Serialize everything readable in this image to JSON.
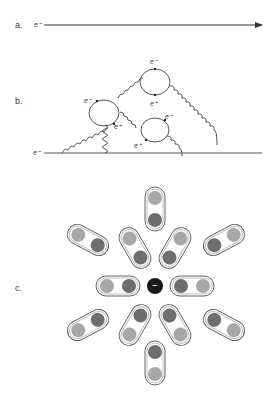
{
  "panels": {
    "a": {
      "label": "a.",
      "particle": "e⁻"
    },
    "b": {
      "label": "b.",
      "incoming_particle": "e⁻",
      "loops": [
        {
          "top": "e⁻",
          "bottom": "e⁺"
        },
        {
          "top": "e⁻",
          "bottom": "e⁺"
        },
        {
          "top": "e⁻",
          "bottom": "e⁺"
        }
      ]
    },
    "c": {
      "label": "c.",
      "central_charge": "−",
      "dipoles": [
        {
          "orientation": "up",
          "inner": "+",
          "outer": "−"
        },
        {
          "orientation": "down",
          "inner": "+",
          "outer": "−"
        },
        {
          "orientation": "left",
          "inner": "+",
          "outer": "−"
        },
        {
          "orientation": "right",
          "inner": "+",
          "outer": "−"
        },
        {
          "orientation": "up-left-inner",
          "inner": "+",
          "outer": "−"
        },
        {
          "orientation": "up-right-inner",
          "inner": "+",
          "outer": "−"
        },
        {
          "orientation": "down-left-inner",
          "inner": "+",
          "outer": "−"
        },
        {
          "orientation": "down-right-inner",
          "inner": "+",
          "outer": "−"
        },
        {
          "orientation": "up-left-outer",
          "inner": "+",
          "outer": "−"
        },
        {
          "orientation": "up-right-outer",
          "inner": "+",
          "outer": "−"
        },
        {
          "orientation": "down-left-outer",
          "inner": "+",
          "outer": "−"
        },
        {
          "orientation": "down-right-outer",
          "inner": "+",
          "outer": "−"
        }
      ]
    }
  },
  "colors": {
    "line": "#444444",
    "plus_fill": "#6e6e6e",
    "minus_fill": "#a8a8a8",
    "center_fill": "#1a1a1a",
    "capsule_stroke": "#555555"
  }
}
